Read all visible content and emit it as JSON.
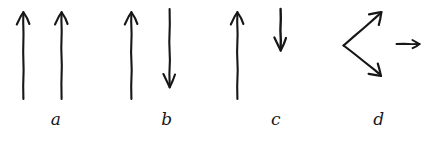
{
  "figure": {
    "background_color": "#ffffff",
    "ink_color": "#171717",
    "style": "hand-drawn pen sketch",
    "panel_count": 4
  },
  "panels": [
    {
      "id": "a",
      "label": "a",
      "description": "two long parallel arrows both pointing up",
      "arrows": [
        {
          "name": "arrow-a-1",
          "direction": "up",
          "length": "long",
          "tail": [
            14,
            98
          ],
          "tip": [
            14,
            12
          ]
        },
        {
          "name": "arrow-a-2",
          "direction": "up",
          "length": "long",
          "tail": [
            52,
            98
          ],
          "tip": [
            52,
            12
          ]
        }
      ]
    },
    {
      "id": "b",
      "label": "b",
      "description": "one long arrow pointing up beside one long arrow pointing down",
      "arrows": [
        {
          "name": "arrow-b-1",
          "direction": "up",
          "length": "long",
          "tail": [
            14,
            98
          ],
          "tip": [
            14,
            12
          ]
        },
        {
          "name": "arrow-b-2",
          "direction": "down",
          "length": "long",
          "tail": [
            52,
            10
          ],
          "tip": [
            52,
            86
          ]
        }
      ]
    },
    {
      "id": "c",
      "label": "c",
      "description": "one long arrow pointing up beside one short arrow pointing down",
      "arrows": [
        {
          "name": "arrow-c-1",
          "direction": "up",
          "length": "long",
          "tail": [
            14,
            98
          ],
          "tip": [
            14,
            12
          ]
        },
        {
          "name": "arrow-c-2",
          "direction": "down",
          "length": "short",
          "tail": [
            54,
            10
          ],
          "tip": [
            54,
            48
          ]
        }
      ]
    },
    {
      "id": "d",
      "label": "d",
      "description": "two arrows diverging from a common vertex forming a sideways V, plus a small arrow pointing right",
      "arrows": [
        {
          "name": "arrow-d-upper",
          "direction": "up-right",
          "length": "medium",
          "tail": [
            14,
            42
          ],
          "tip": [
            52,
            10
          ]
        },
        {
          "name": "arrow-d-lower",
          "direction": "down-right",
          "length": "medium",
          "tail": [
            14,
            42
          ],
          "tip": [
            52,
            74
          ]
        },
        {
          "name": "arrow-d-result",
          "direction": "right",
          "length": "short",
          "tail": [
            66,
            42
          ],
          "tip": [
            92,
            42
          ]
        }
      ]
    }
  ]
}
